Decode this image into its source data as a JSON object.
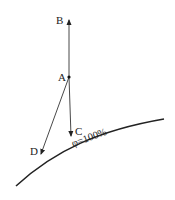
{
  "diagram": {
    "points": {
      "A": {
        "label": "A",
        "x": 69,
        "y": 77
      },
      "B": {
        "label": "B",
        "x": 69,
        "y": 19
      },
      "C": {
        "label": "C",
        "x": 71,
        "y": 137
      },
      "D": {
        "label": "D",
        "x": 41,
        "y": 155
      }
    },
    "vectors": [
      {
        "from": "A",
        "to": "B"
      },
      {
        "from": "A",
        "to": "C"
      },
      {
        "from": "A",
        "to": "D"
      }
    ],
    "curve": {
      "label": "φ=100%"
    },
    "colors": {
      "stroke": "#222222"
    }
  }
}
